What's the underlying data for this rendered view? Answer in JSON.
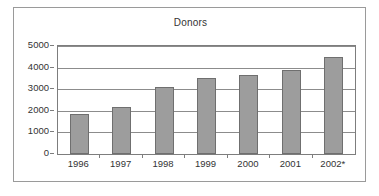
{
  "chart_data": {
    "type": "bar",
    "title": "Donors",
    "xlabel": "",
    "ylabel": "",
    "categories": [
      "1996",
      "1997",
      "1998",
      "1999",
      "2000",
      "2001",
      "2002*"
    ],
    "values": [
      1830,
      2180,
      3120,
      3520,
      3650,
      3880,
      4470
    ],
    "ylim": [
      0,
      5000
    ],
    "yticks": [
      0,
      1000,
      2000,
      3000,
      4000,
      5000
    ],
    "ytick_labels": [
      "0",
      "1000",
      "2000",
      "3000",
      "4000",
      "5000"
    ],
    "grid": true,
    "legend": false,
    "bar_color": "#9d9d9d",
    "bar_border_color": "#6f6f6f",
    "gridline_color": "#8c8c8c",
    "axis_color": "#7d7d7d",
    "frame_color": "#9a9a9a",
    "background": "#ffffff",
    "text_color": "#333333"
  }
}
